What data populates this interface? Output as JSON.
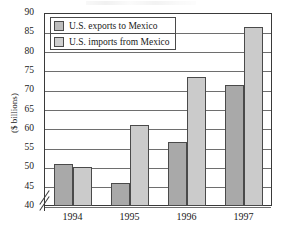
{
  "chart_data": {
    "type": "bar",
    "title": "",
    "xlabel": "",
    "ylabel": "($ billions)",
    "categories": [
      "1994",
      "1995",
      "1996",
      "1997"
    ],
    "series": [
      {
        "name": "U.S. exports to Mexico",
        "values": [
          50.8,
          46.0,
          56.5,
          71.3
        ]
      },
      {
        "name": "U.S. imports from Mexico",
        "values": [
          50.0,
          61.0,
          73.3,
          86.3
        ]
      }
    ],
    "ylim": [
      40,
      90
    ],
    "yticks": [
      40,
      45,
      50,
      55,
      60,
      65,
      70,
      75,
      80,
      85,
      90
    ],
    "ytick_labels": [
      "40",
      "45",
      "50",
      "55",
      "60",
      "65",
      "70",
      "75",
      "80",
      "85",
      "90"
    ],
    "grid": true,
    "axis_break": true,
    "axis_break_symbol": "//",
    "legend_position": "top-left",
    "colors": {
      "exports_fill": "#a9a9a9",
      "imports_fill": "#cbcbcb",
      "bar_outline": "#4a4a4a",
      "gridline": "#6e6e6e",
      "frame": "#3a3a3a",
      "background": "#ffffff",
      "text": "#1a1a1a"
    }
  },
  "legend": {
    "items": [
      {
        "label": "U.S. exports to Mexico"
      },
      {
        "label": "U.S. imports from Mexico"
      }
    ]
  }
}
